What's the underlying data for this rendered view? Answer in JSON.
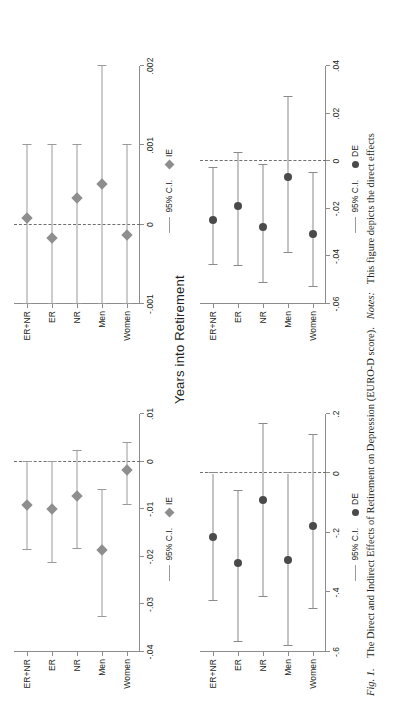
{
  "figure": {
    "caption_label": "Fig. 1.",
    "caption_title": "The Direct and Indirect Effects of Retirement on Depression (EURO-D score).",
    "caption_notes_label": "Notes:",
    "caption_notes_text": "This figure depicts the direct effects",
    "axis_title": "Years into Retirement",
    "categories": [
      "ER+NR",
      "ER",
      "NR",
      "Men",
      "Women"
    ],
    "legend": {
      "ci_label": "95% C.I.",
      "ie_label": "IE",
      "de_label": "DE"
    },
    "colors": {
      "ie_marker": "#8e8e8e",
      "de_marker": "#4a4a4a",
      "ci_line": "#9a9a9a",
      "axis": "#8c8c8c",
      "zero_line": "#6f6f6f",
      "text": "#231f20",
      "background": "#ffffff"
    }
  },
  "chart_data": [
    {
      "id": "panel-ie-left",
      "type": "scatter",
      "orientation": "horizontal-forest",
      "series_name": "IE",
      "marker": "diamond",
      "title": "",
      "xlabel": "",
      "ylabel": "",
      "xlim": [
        -0.04,
        0.01
      ],
      "xticks": [
        -0.04,
        -0.03,
        -0.02,
        -0.01,
        0,
        0.01
      ],
      "xticklabels": [
        "-.04",
        "-.03",
        "-.02",
        "-.01",
        "0",
        ".01"
      ],
      "categories": [
        "ER+NR",
        "ER",
        "NR",
        "Men",
        "Women"
      ],
      "values": [
        -0.0091,
        -0.0099,
        -0.0072,
        -0.0186,
        -0.0017
      ],
      "ci_low": [
        -0.0185,
        -0.0212,
        -0.0183,
        -0.0327,
        -0.0092
      ],
      "ci_high": [
        0.0,
        0.0,
        0.0023,
        -0.006,
        0.004
      ],
      "zero_reference": 0,
      "grid": false,
      "legend_position": "bottom"
    },
    {
      "id": "panel-ie-right",
      "type": "scatter",
      "orientation": "horizontal-forest",
      "series_name": "IE",
      "marker": "diamond",
      "title": "",
      "xlabel": "",
      "ylabel": "",
      "xlim": [
        -0.001,
        0.002
      ],
      "xticks": [
        -0.001,
        0,
        0.001,
        0.002
      ],
      "xticklabels": [
        "-.001",
        "0",
        ".001",
        ".002"
      ],
      "categories": [
        "ER+NR",
        "ER",
        "NR",
        "Men",
        "Women"
      ],
      "values": [
        8e-05,
        -0.00017,
        0.00033,
        0.00051,
        -0.00013
      ],
      "ci_low": [
        -0.001,
        -0.001,
        -0.001,
        -0.001,
        -0.001
      ],
      "ci_high": [
        0.001,
        0.001,
        0.001,
        0.002,
        0.001
      ],
      "zero_reference": 0,
      "grid": false,
      "legend_position": "bottom"
    },
    {
      "id": "panel-de-left",
      "type": "scatter",
      "orientation": "horizontal-forest",
      "series_name": "DE",
      "marker": "circle",
      "title": "",
      "xlabel": "",
      "ylabel": "",
      "xlim": [
        -0.6,
        0.2
      ],
      "xticks": [
        -0.6,
        -0.4,
        -0.2,
        0,
        0.2
      ],
      "xticklabels": [
        "-.6",
        "-.4",
        "-.2",
        "0",
        ".2"
      ],
      "categories": [
        "ER+NR",
        "ER",
        "NR",
        "Men",
        "Women"
      ],
      "values": [
        -0.215,
        -0.3,
        -0.09,
        -0.29,
        -0.175
      ],
      "ci_low": [
        -0.43,
        -0.565,
        -0.415,
        -0.58,
        -0.455
      ],
      "ci_high": [
        0.0,
        -0.06,
        0.165,
        0.0,
        0.13
      ],
      "zero_reference": 0,
      "grid": false,
      "legend_position": "bottom"
    },
    {
      "id": "panel-de-right",
      "type": "scatter",
      "orientation": "horizontal-forest",
      "series_name": "DE",
      "marker": "circle",
      "title": "",
      "xlabel": "",
      "ylabel": "",
      "xlim": [
        -0.06,
        0.04
      ],
      "xticks": [
        -0.06,
        -0.04,
        -0.02,
        0,
        0.02,
        0.04
      ],
      "xticklabels": [
        "-.06",
        "-.04",
        "-.02",
        "0",
        ".02",
        ".04"
      ],
      "categories": [
        "ER+NR",
        "ER",
        "NR",
        "Men",
        "Women"
      ],
      "values": [
        -0.0245,
        -0.019,
        -0.0275,
        -0.0065,
        -0.0305
      ],
      "ci_low": [
        -0.0435,
        -0.044,
        -0.051,
        -0.0385,
        -0.053
      ],
      "ci_high": [
        -0.003,
        0.0035,
        -0.0015,
        0.027,
        -0.005
      ],
      "zero_reference": 0,
      "grid": false,
      "legend_position": "bottom"
    }
  ]
}
